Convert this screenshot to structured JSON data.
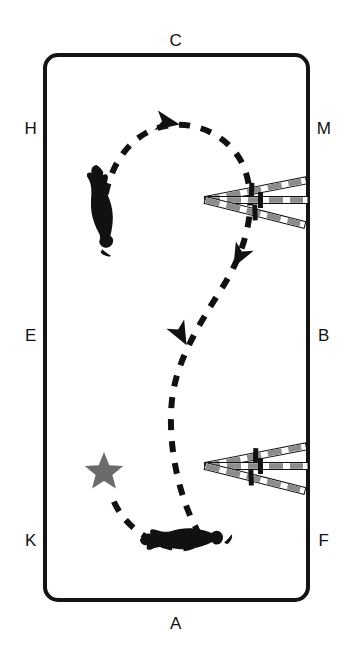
{
  "diagram": {
    "arena": {
      "name": "dressage-arena",
      "border_color": "#141414",
      "fill_color": "#ffffff",
      "x": 45,
      "y": 55,
      "width": 263,
      "height": 545,
      "corner_radius": 13,
      "stroke_width": 4
    },
    "letters": [
      {
        "id": "C",
        "label": "C",
        "x": 176,
        "y": 42,
        "position": "top-center"
      },
      {
        "id": "H",
        "label": "H",
        "x": 31,
        "y": 130,
        "position": "left-upper"
      },
      {
        "id": "M",
        "label": "M",
        "x": 324,
        "y": 130,
        "position": "right-upper"
      },
      {
        "id": "E",
        "label": "E",
        "x": 31,
        "y": 337,
        "position": "left-center"
      },
      {
        "id": "B",
        "label": "B",
        "x": 324,
        "y": 337,
        "position": "right-center"
      },
      {
        "id": "K",
        "label": "K",
        "x": 31,
        "y": 542,
        "position": "left-lower"
      },
      {
        "id": "F",
        "label": "F",
        "x": 324,
        "y": 542,
        "position": "right-lower"
      },
      {
        "id": "A",
        "label": "A",
        "x": 176,
        "y": 625,
        "position": "bottom-center"
      }
    ],
    "path": {
      "name": "riding-track",
      "style": "dashed",
      "color": "#111111",
      "stroke_width": 6,
      "dash_pattern": "11 11",
      "description": "S-shaped serpentine loop ridden counter-clockwise at top and clockwise at bottom"
    },
    "arrows": [
      {
        "id": "arrow-top",
        "label": "direction-arrow-top",
        "x": 166,
        "y": 122,
        "rotation": 10
      },
      {
        "id": "arrow-middle",
        "label": "direction-arrow-middle",
        "x": 180,
        "y": 333,
        "rotation": 62
      },
      {
        "id": "arrow-free",
        "label": "direction-arrow-free",
        "x": 240,
        "y": 255,
        "rotation": 118
      }
    ],
    "pole_fans": [
      {
        "id": "fan-upper",
        "label": "pole-fan-upper",
        "apex_x": 205,
        "apex_y": 200,
        "poles": [
          {
            "id": "upper-pole-top",
            "angle": -11,
            "marker_offset": 0.46
          },
          {
            "id": "upper-pole-middle",
            "angle": 0,
            "marker_offset": 0.54
          },
          {
            "id": "upper-pole-bottom",
            "angle": 14,
            "marker_offset": 0.5
          }
        ]
      },
      {
        "id": "fan-lower",
        "label": "pole-fan-lower",
        "apex_x": 205,
        "apex_y": 466,
        "poles": [
          {
            "id": "lower-pole-top",
            "angle": -11,
            "marker_offset": 0.5
          },
          {
            "id": "lower-pole-middle",
            "angle": 0,
            "marker_offset": 0.54
          },
          {
            "id": "lower-pole-bottom",
            "angle": 14,
            "marker_offset": 0.46
          }
        ]
      }
    ],
    "pole": {
      "length": 103,
      "thickness": 7,
      "stripe_color": "#8c8c8c",
      "gap_color": "#ffffff",
      "outline_color": "#111111",
      "marker_color": "#111111",
      "marker_length": 16,
      "marker_thickness": 5
    },
    "star": {
      "id": "start-marker-star",
      "label": "star-marker",
      "x": 104,
      "y": 470,
      "radius": 16,
      "color": "#6b6b6b"
    },
    "horses": [
      {
        "id": "horse-left",
        "label": "horse-and-rider-left",
        "x": 100,
        "y": 205,
        "rotation": -8,
        "scale": 1.0
      },
      {
        "id": "horse-bottom",
        "label": "horse-and-rider-bottom",
        "x": 180,
        "y": 540,
        "rotation": 268,
        "scale": 0.95
      }
    ],
    "colors": {
      "ink": "#111111",
      "pole_gray": "#8c8c8c",
      "star_gray": "#6b6b6b",
      "background": "#ffffff"
    }
  }
}
